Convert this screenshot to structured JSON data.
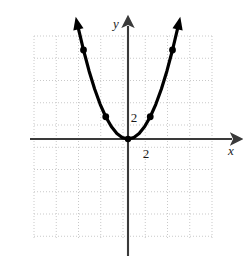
{
  "figure": {
    "title": "",
    "background_color": "#ffffff",
    "width": 243,
    "height": 259
  },
  "axes": {
    "x_axis_label": "x",
    "y_axis_label": "y",
    "axis_color": "#3a3a3a",
    "origin_px": {
      "x": 128,
      "y": 139
    },
    "unit_px": 22.25,
    "x_axis_y_px": 139,
    "y_axis_x_px": 128,
    "x_axis_start_px": 30,
    "x_axis_end_px": 232,
    "y_axis_start_px": 26,
    "y_axis_end_px": 256,
    "arrowheads": [
      "x-positive",
      "y-positive"
    ]
  },
  "grid": {
    "visible": true,
    "style": "dotted",
    "color": "#c9c9c9",
    "left_px": 34,
    "top_px": 36,
    "right_px": 212,
    "bottom_px": 238,
    "cell_px": 22.25,
    "columns": 8,
    "rows": 9
  },
  "tick_labels": [
    {
      "name": "y-tick-2",
      "text": "2",
      "x_px": 134,
      "y_px": 122,
      "axis": "y"
    },
    {
      "name": "x-tick-2",
      "text": "2",
      "x_px": 146,
      "y_px": 158,
      "axis": "x"
    }
  ],
  "chart_data": {
    "type": "line",
    "title": "",
    "xlabel": "x",
    "ylabel": "y",
    "grid": true,
    "legend": null,
    "xlim": [
      -4.2,
      3.8
    ],
    "ylim": [
      -4.6,
      4.6
    ],
    "curve_color": "#000000",
    "curve_width_px": 3.2,
    "function": "y = x^2",
    "series": [
      {
        "name": "parabola",
        "x": [
          -2.22,
          -2.0,
          -1.75,
          -1.5,
          -1.25,
          -1.0,
          -0.75,
          -0.5,
          -0.25,
          0,
          0.25,
          0.5,
          0.75,
          1.0,
          1.25,
          1.5,
          1.75,
          2.0,
          2.22
        ],
        "y": [
          4.93,
          4.0,
          3.06,
          2.25,
          1.56,
          1.0,
          0.56,
          0.25,
          0.06,
          0,
          0.06,
          0.25,
          0.56,
          1.0,
          1.56,
          2.25,
          3.06,
          4.0,
          4.93
        ]
      }
    ],
    "points": [
      {
        "name": "point-left-outer",
        "x": -2.0,
        "y": 4.0
      },
      {
        "name": "point-left-inner",
        "x": -1.0,
        "y": 1.0
      },
      {
        "name": "point-vertex",
        "x": 0.0,
        "y": 0.0
      },
      {
        "name": "point-right-inner",
        "x": 1.0,
        "y": 1.0
      },
      {
        "name": "point-right-outer",
        "x": 2.0,
        "y": 4.0
      }
    ],
    "annotations": [
      {
        "text": "2",
        "x": 0.27,
        "y": 1.0
      },
      {
        "text": "2",
        "x": 0.82,
        "y": -0.62
      }
    ],
    "curve_arrowheads": [
      {
        "name": "arrow-left-end",
        "x": -2.35,
        "y": 5.5
      },
      {
        "name": "arrow-right-end",
        "x": 2.35,
        "y": 5.5
      }
    ]
  }
}
